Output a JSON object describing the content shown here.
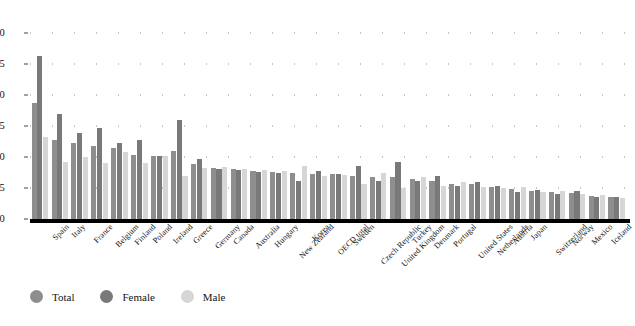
{
  "chart_data": {
    "type": "bar",
    "title": "",
    "subtitle": "",
    "xlabel": "",
    "ylabel": "",
    "ylim": [
      0,
      30
    ],
    "yticks": [
      0,
      5,
      10,
      15,
      20,
      25,
      30
    ],
    "grid": true,
    "legend_position": "bottom-left",
    "categories": [
      "Spain",
      "Italy",
      "France",
      "Belgium",
      "Finland",
      "Poland",
      "Ireland",
      "Greece",
      "Germany",
      "Canada",
      "Australia",
      "Hungary",
      "New Zealand",
      "Korea",
      "OECD total",
      "Sweden",
      "Czech Republic",
      "United Kingdom",
      "Turkey",
      "Denmark",
      "Portugal",
      "United States",
      "Netherlands",
      "Austria",
      "Japan",
      "Switzerland",
      "Norway",
      "Mexico",
      "Iceland",
      "Luxembourg"
    ],
    "series": [
      {
        "name": "Total",
        "color": "#8e8e8e",
        "values": [
          18.7,
          12.7,
          12.3,
          11.8,
          11.4,
          10.3,
          10.2,
          11.0,
          8.9,
          8.2,
          8.0,
          7.8,
          7.6,
          7.5,
          7.3,
          7.2,
          7.0,
          6.8,
          6.7,
          6.5,
          6.1,
          5.7,
          5.6,
          5.2,
          4.8,
          4.5,
          4.3,
          4.2,
          3.7,
          3.5
        ]
      },
      {
        "name": "Female",
        "color": "#797979",
        "values": [
          26.3,
          17.0,
          13.9,
          14.6,
          12.2,
          12.7,
          10.2,
          16.0,
          9.7,
          8.0,
          7.9,
          7.6,
          7.5,
          6.1,
          7.8,
          7.3,
          8.6,
          6.1,
          9.2,
          6.2,
          7.0,
          5.4,
          6.0,
          5.4,
          4.4,
          4.6,
          4.1,
          4.5,
          3.5,
          3.6
        ]
      },
      {
        "name": "Male",
        "color": "#d6d6d6",
        "values": [
          13.3,
          9.2,
          10.0,
          9.1,
          10.8,
          9.0,
          10.2,
          6.9,
          8.2,
          8.4,
          8.1,
          7.9,
          7.7,
          8.6,
          6.9,
          7.1,
          5.7,
          7.4,
          5.0,
          6.7,
          5.3,
          6.0,
          5.2,
          5.0,
          5.1,
          4.4,
          4.5,
          4.0,
          3.9,
          3.4
        ]
      }
    ]
  },
  "legend": {
    "items": [
      {
        "label": "Total",
        "color": "#8e8e8e"
      },
      {
        "label": "Female",
        "color": "#797979"
      },
      {
        "label": "Male",
        "color": "#d6d6d6"
      }
    ]
  }
}
